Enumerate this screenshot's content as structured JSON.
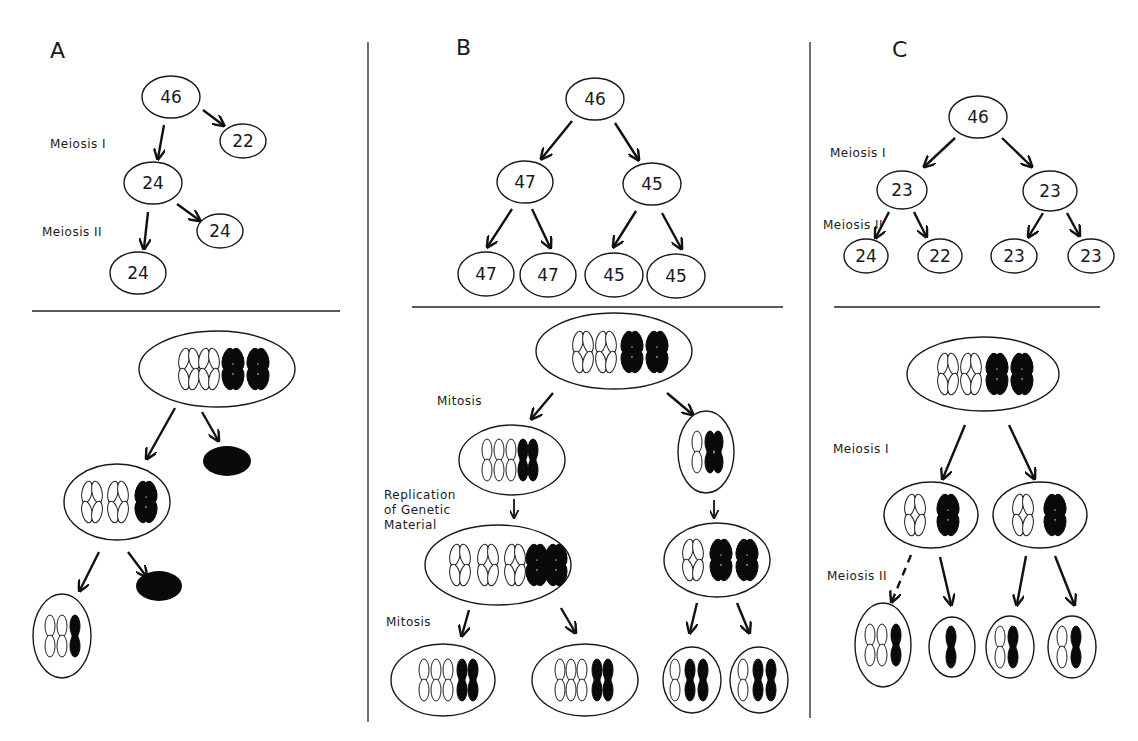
{
  "panels": [
    {
      "id": "A",
      "label": "A",
      "stage_labels": {
        "meiosis1": "Meiosis I",
        "meiosis2": "Meiosis II"
      },
      "counts": {
        "parent": "46",
        "polar1": "22",
        "secondary": "24",
        "polar2": "24",
        "gamete": "24"
      }
    },
    {
      "id": "B",
      "label": "B",
      "stage_labels": {
        "mitosis_top": "Mitosis",
        "replication": [
          "Replication",
          "of Genetic",
          "Material"
        ],
        "mitosis_bottom": "Mitosis"
      },
      "counts": {
        "parent": "46",
        "left": "47",
        "right": "45",
        "ll": "47",
        "lr": "47",
        "rl": "45",
        "rr": "45"
      }
    },
    {
      "id": "C",
      "label": "C",
      "stage_labels": {
        "meiosis1": "Meiosis I",
        "meiosis2": "Meiosis II"
      },
      "counts": {
        "parent": "46",
        "left": "23",
        "right": "23",
        "ll": "24",
        "lr": "22",
        "rl": "23",
        "rr": "23"
      }
    }
  ],
  "colors": {
    "ink": "#111111",
    "background": "#ffffff"
  }
}
